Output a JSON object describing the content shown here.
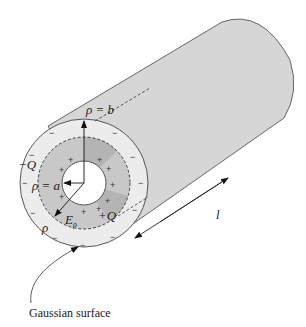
{
  "figure": {
    "type": "coaxial-cylinder-gauss-law",
    "labels": {
      "rho_b": "ρ = b",
      "rho_a": "ρ = a",
      "neg_charge": "−Q",
      "pos_charge": "+Q",
      "rho": "ρ",
      "field": "E",
      "field_sub": "ρ",
      "length": "l"
    },
    "caption": "Gaussian surface",
    "colors": {
      "cylinder_body": "#d6d6d6",
      "outer_shell": "#ececec",
      "gaussian_region": "#c8c8c8",
      "gaussian_region_dark": "#b4b4b4",
      "inner_hole": "#ffffff",
      "stroke": "#444444"
    },
    "signs": {
      "minus": "−",
      "plus": "+"
    }
  }
}
